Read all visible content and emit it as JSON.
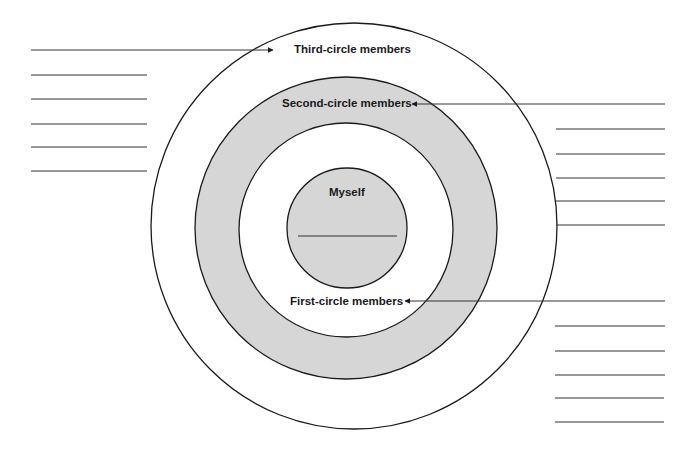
{
  "diagram": {
    "type": "concentric-circles",
    "colors": {
      "line": "#1a1a1a",
      "shade": "#d6d6d6",
      "background": "#ffffff"
    },
    "circles": [
      {
        "name": "third-circle",
        "label": "Third-circle members",
        "fill": "white"
      },
      {
        "name": "second-circle",
        "label": "Second-circle members",
        "fill": "shaded"
      },
      {
        "name": "first-circle",
        "label": "First-circle members",
        "fill": "white"
      },
      {
        "name": "myself",
        "label": "Myself",
        "fill": "shaded"
      }
    ],
    "blank_lines": {
      "left_group": 6,
      "right_upper_group": 6,
      "right_lower_group": 6,
      "myself_circle": 1
    }
  }
}
